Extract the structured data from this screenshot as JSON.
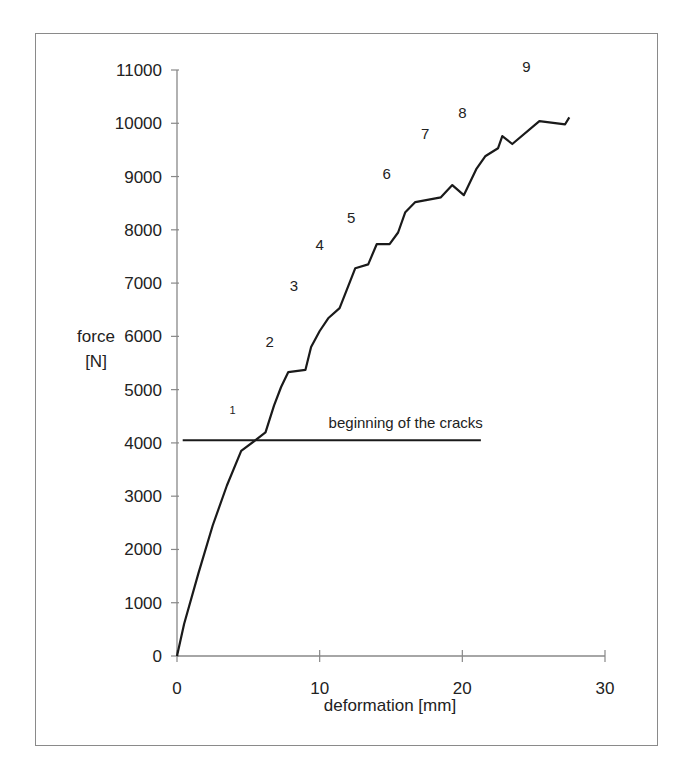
{
  "chart_data": {
    "type": "line",
    "title": "",
    "xlabel": "deformation [mm]",
    "ylabel": "force\n[N]",
    "ylabel_lines": [
      "force",
      "[N]"
    ],
    "xlim": [
      0,
      30
    ],
    "ylim": [
      0,
      11000
    ],
    "x_ticks": [
      0,
      10,
      20,
      30
    ],
    "y_ticks": [
      0,
      1000,
      2000,
      3000,
      4000,
      5000,
      6000,
      7000,
      8000,
      9000,
      10000,
      11000
    ],
    "grid": false,
    "legend": null,
    "series": [
      {
        "name": "force-deformation curve",
        "color": "#1a1a1a",
        "x": [
          0,
          0.5,
          1.5,
          2.5,
          3.5,
          4.5,
          5.5,
          6.2,
          6.8,
          7.3,
          7.8,
          9.0,
          9.4,
          10.0,
          10.6,
          11.4,
          11.8,
          12.5,
          13.4,
          14.0,
          14.9,
          15.5,
          16.0,
          16.7,
          18.5,
          19.3,
          20.1,
          21.0,
          21.6,
          22.5,
          22.8,
          23.5,
          25.4,
          27.2,
          27.5
        ],
        "y": [
          0,
          600,
          1550,
          2450,
          3200,
          3850,
          4050,
          4200,
          4700,
          5050,
          5330,
          5370,
          5800,
          6100,
          6340,
          6530,
          6800,
          7280,
          7350,
          7730,
          7730,
          7950,
          8330,
          8520,
          8610,
          8840,
          8650,
          9150,
          9380,
          9530,
          9760,
          9610,
          10040,
          9980,
          10110
        ]
      }
    ],
    "reference_lines": [
      {
        "type": "horizontal",
        "y": 4050,
        "x_start": 0.4,
        "x_end": 21.3,
        "label": "beginning of the cracks"
      }
    ],
    "annotations": [
      {
        "text": "1",
        "x": 3.9,
        "y": 4550
      },
      {
        "text": "2",
        "x": 6.5,
        "y": 5800
      },
      {
        "text": "3",
        "x": 8.2,
        "y": 6850
      },
      {
        "text": "4",
        "x": 10.0,
        "y": 7620
      },
      {
        "text": "5",
        "x": 12.2,
        "y": 8120
      },
      {
        "text": "6",
        "x": 14.7,
        "y": 8950
      },
      {
        "text": "7",
        "x": 17.4,
        "y": 9700
      },
      {
        "text": "8",
        "x": 20.0,
        "y": 10100
      },
      {
        "text": "9",
        "x": 24.5,
        "y": 10970
      }
    ]
  }
}
